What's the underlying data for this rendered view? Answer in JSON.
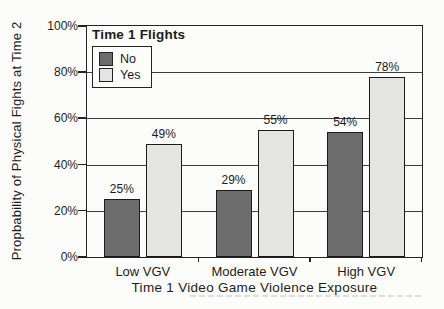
{
  "chart_data": {
    "type": "bar",
    "categories": [
      "Low VGV",
      "Moderate VGV",
      "High VGV"
    ],
    "series": [
      {
        "name": "No",
        "values": [
          25,
          29,
          54
        ],
        "value_labels": [
          "25%",
          "29%",
          "54%"
        ],
        "color": "#6c6c6c"
      },
      {
        "name": "Yes",
        "values": [
          49,
          55,
          78
        ],
        "value_labels": [
          "49%",
          "55%",
          "78%"
        ],
        "color": "#e4e4e2"
      }
    ],
    "legend_title": "Time 1 Flights",
    "legend_position": "top-left-inside",
    "xlabel": "Time 1 Video Game Violence Exposure",
    "ylabel": "Propbability of Physical Fights at Time 2",
    "ylim": [
      0,
      100
    ],
    "yticks": [
      0,
      20,
      40,
      60,
      80,
      100
    ],
    "ytick_labels": [
      "0%",
      "20%",
      "40%",
      "60%",
      "80%",
      "100%"
    ],
    "grid": true,
    "colors": {
      "paper": "#fcfcfa",
      "bar_no": "#6c6c6c",
      "bar_yes": "#e4e4e2",
      "line": "#222222",
      "text": "#1c1c1c"
    }
  }
}
